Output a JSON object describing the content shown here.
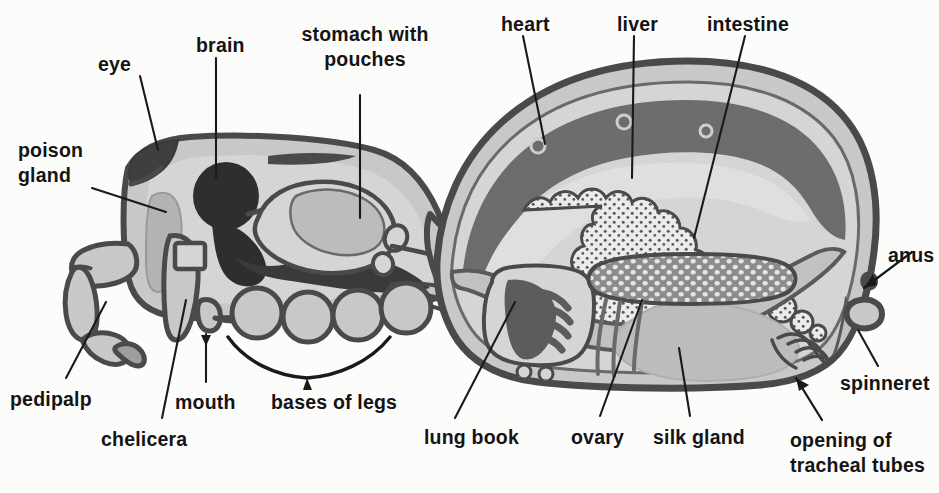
{
  "figure": {
    "width": 939,
    "height": 493,
    "background_color": "#fdfdfc",
    "ink_color": "#141414"
  },
  "palette": {
    "outline": "#4a4a4a",
    "body_fill": "#c9c9c9",
    "body_fill_light": "#d6d6d6",
    "body_fill_lighter": "#dedede",
    "heart_dark": "#6d6d6d",
    "brain_dark": "#2e2e2e",
    "nerve_dark": "#3a3a3a",
    "lungbook_dark": "#5c5c5c",
    "liver_stipple_bg": "#ececec",
    "ovary_bg": "#8d8d8d",
    "ovary_cell": "#e4e4e4",
    "silk_gland": "#bdbdbd",
    "poison_gland": "#b4b4b4",
    "label_text": "#141414",
    "leader_line": "#1a1a1a"
  },
  "labels": [
    {
      "id": "eye",
      "text": "eye",
      "x": 98,
      "y": 62,
      "align": "l",
      "lines": 1
    },
    {
      "id": "brain",
      "text": "brain",
      "x": 196,
      "y": 33,
      "align": "l",
      "lines": 1
    },
    {
      "id": "stomach",
      "text": "stomach with\npouches",
      "x": 365,
      "y": 22,
      "align": "c",
      "lines": 2
    },
    {
      "id": "heart",
      "text": "heart",
      "x": 501,
      "y": 12,
      "align": "l",
      "lines": 1
    },
    {
      "id": "liver",
      "text": "liver",
      "x": 617,
      "y": 12,
      "align": "l",
      "lines": 1
    },
    {
      "id": "intestine",
      "text": "intestine",
      "x": 707,
      "y": 12,
      "align": "l",
      "lines": 1
    },
    {
      "id": "poison-gland",
      "text": "poison\ngland",
      "x": 18,
      "y": 138,
      "align": "l",
      "lines": 2
    },
    {
      "id": "anus",
      "text": "anus",
      "x": 888,
      "y": 243,
      "align": "l",
      "lines": 1
    },
    {
      "id": "pedipalp",
      "text": "pedipalp",
      "x": 10,
      "y": 387,
      "align": "l",
      "lines": 1
    },
    {
      "id": "mouth",
      "text": "mouth",
      "x": 175,
      "y": 390,
      "align": "l",
      "lines": 1
    },
    {
      "id": "bases-of-legs",
      "text": "bases of legs",
      "x": 271,
      "y": 390,
      "align": "l",
      "lines": 1
    },
    {
      "id": "chelicera",
      "text": "chelicera",
      "x": 101,
      "y": 427,
      "align": "l",
      "lines": 1
    },
    {
      "id": "lung-book",
      "text": "lung book",
      "x": 424,
      "y": 425,
      "align": "l",
      "lines": 1
    },
    {
      "id": "ovary",
      "text": "ovary",
      "x": 571,
      "y": 425,
      "align": "l",
      "lines": 1
    },
    {
      "id": "silk-gland",
      "text": "silk gland",
      "x": 653,
      "y": 425,
      "align": "l",
      "lines": 1
    },
    {
      "id": "spinneret",
      "text": "spinneret",
      "x": 840,
      "y": 371,
      "align": "l",
      "lines": 1
    },
    {
      "id": "tracheal-opening",
      "text": "opening of\ntracheal tubes",
      "x": 790,
      "y": 428,
      "align": "l",
      "lines": 2
    }
  ],
  "structures": [
    {
      "id": "cephalothorax",
      "name": "cephalothorax"
    },
    {
      "id": "abdomen",
      "name": "abdomen"
    },
    {
      "id": "pedicel",
      "name": "pedicel-waist"
    },
    {
      "id": "eye",
      "name": "eye"
    },
    {
      "id": "brain",
      "name": "brain"
    },
    {
      "id": "poison-gland",
      "name": "poison-gland"
    },
    {
      "id": "chelicera",
      "name": "chelicera"
    },
    {
      "id": "pedipalp",
      "name": "pedipalp"
    },
    {
      "id": "mouth",
      "name": "mouth"
    },
    {
      "id": "stomach",
      "name": "stomach-with-pouches"
    },
    {
      "id": "nerve-cord",
      "name": "nerve-cord"
    },
    {
      "id": "leg-bases",
      "name": "bases-of-legs"
    },
    {
      "id": "heart",
      "name": "heart"
    },
    {
      "id": "liver",
      "name": "liver"
    },
    {
      "id": "intestine",
      "name": "intestine"
    },
    {
      "id": "lung-book",
      "name": "lung-book"
    },
    {
      "id": "ovary",
      "name": "ovary"
    },
    {
      "id": "silk-gland",
      "name": "silk-gland"
    },
    {
      "id": "tracheal-tubes",
      "name": "tracheal-tubes"
    },
    {
      "id": "anus",
      "name": "anus"
    },
    {
      "id": "spinneret",
      "name": "spinneret"
    }
  ],
  "heart_ostia_count": 3,
  "leg_base_count": 4
}
